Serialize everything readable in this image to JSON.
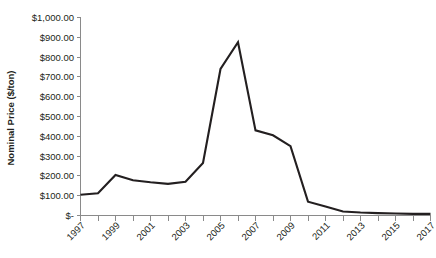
{
  "chart_data": {
    "type": "line",
    "title": "",
    "xlabel": "",
    "ylabel": "Nominal Price ($/ton)",
    "grid": false,
    "legend": false,
    "xlim": [
      1997,
      2017
    ],
    "ylim": [
      0,
      1000
    ],
    "x": [
      1997,
      1998,
      1999,
      2000,
      2001,
      2002,
      2003,
      2004,
      2005,
      2006,
      2007,
      2008,
      2009,
      2010,
      2011,
      2012,
      2013,
      2014,
      2015,
      2016,
      2017
    ],
    "values": [
      105,
      112,
      205,
      178,
      168,
      160,
      170,
      265,
      740,
      875,
      430,
      405,
      350,
      70,
      45,
      20,
      15,
      12,
      10,
      8,
      8
    ],
    "series": [
      {
        "name": "Nominal Price",
        "values": [
          105,
          112,
          205,
          178,
          168,
          160,
          170,
          265,
          740,
          875,
          430,
          405,
          350,
          70,
          45,
          20,
          15,
          12,
          10,
          8,
          8
        ]
      }
    ],
    "categories": [
      "1997",
      "1998",
      "1999",
      "2000",
      "2001",
      "2002",
      "2003",
      "2004",
      "2005",
      "2006",
      "2007",
      "2008",
      "2009",
      "2010",
      "2011",
      "2012",
      "2013",
      "2014",
      "2015",
      "2016",
      "2017"
    ],
    "ytick_values": [
      0,
      100,
      200,
      300,
      400,
      500,
      600,
      700,
      800,
      900,
      1000
    ],
    "ytick_labels": [
      "$-",
      "$100.00",
      "$200.00",
      "$300.00",
      "$400.00",
      "$500.00",
      "$600.00",
      "$700.00",
      "$800.00",
      "$900.00",
      "$1,000.00"
    ],
    "xtick_values": [
      1997,
      1999,
      2001,
      2003,
      2005,
      2007,
      2009,
      2011,
      2013,
      2015,
      2017
    ],
    "xtick_labels": [
      "1997",
      "1999",
      "2001",
      "2003",
      "2005",
      "2007",
      "2009",
      "2011",
      "2013",
      "2015",
      "2017"
    ],
    "xtick_minor_values": [
      1998,
      2000,
      2002,
      2004,
      2006,
      2008,
      2010,
      2012,
      2014,
      2016
    ],
    "colors": {
      "series_line": "#231f20",
      "axis": "#8a8a8a",
      "text": "#231f20",
      "background": "#ffffff"
    }
  }
}
